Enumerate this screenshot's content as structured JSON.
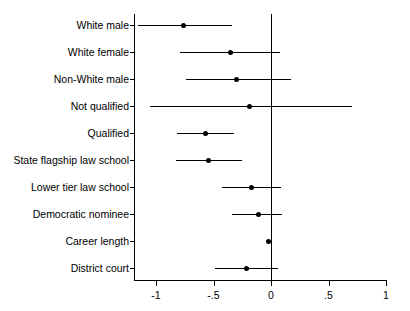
{
  "chart_data": {
    "type": "scatter",
    "subtype": "coefficient-forest-plot",
    "title": "",
    "subtitle": "",
    "xlabel": "",
    "ylabel": "",
    "xlim": [
      -1.25,
      1.05
    ],
    "xticks": [
      -1,
      -0.5,
      0,
      0.5,
      1
    ],
    "xtick_labels": [
      "-1",
      "-.5",
      "0",
      ".5",
      "1"
    ],
    "grid": false,
    "legend": null,
    "reference_line": 0,
    "categories": [
      "White male",
      "White female",
      "Non-White male",
      "Not qualified",
      "Qualified",
      "State flagship law school",
      "Lower tier law school",
      "Democratic nominee",
      "Career length",
      "District court"
    ],
    "estimates": [
      -0.76,
      -0.35,
      -0.3,
      -0.19,
      -0.57,
      -0.54,
      -0.17,
      -0.11,
      -0.02,
      -0.21
    ],
    "ci_low": [
      -1.16,
      -0.79,
      -0.74,
      -1.05,
      -0.82,
      -0.83,
      -0.43,
      -0.34,
      -0.04,
      -0.49
    ],
    "ci_high": [
      -0.34,
      0.08,
      0.17,
      0.7,
      -0.32,
      -0.25,
      0.09,
      0.1,
      0.0,
      0.06
    ],
    "points": [
      {
        "label": "White male",
        "estimate": -0.76,
        "ci_low": -1.16,
        "ci_high": -0.34
      },
      {
        "label": "White female",
        "estimate": -0.35,
        "ci_low": -0.79,
        "ci_high": 0.08
      },
      {
        "label": "Non-White male",
        "estimate": -0.3,
        "ci_low": -0.74,
        "ci_high": 0.17
      },
      {
        "label": "Not qualified",
        "estimate": -0.19,
        "ci_low": -1.05,
        "ci_high": 0.7
      },
      {
        "label": "Qualified",
        "estimate": -0.57,
        "ci_low": -0.82,
        "ci_high": -0.32
      },
      {
        "label": "State flagship law school",
        "estimate": -0.54,
        "ci_low": -0.83,
        "ci_high": -0.25
      },
      {
        "label": "Lower tier law school",
        "estimate": -0.17,
        "ci_low": -0.43,
        "ci_high": 0.09
      },
      {
        "label": "Democratic nominee",
        "estimate": -0.11,
        "ci_low": -0.34,
        "ci_high": 0.1
      },
      {
        "label": "Career length",
        "estimate": -0.02,
        "ci_low": -0.04,
        "ci_high": 0.0
      },
      {
        "label": "District court",
        "estimate": -0.21,
        "ci_low": -0.49,
        "ci_high": 0.06
      }
    ],
    "colors": {
      "marker": "#000000",
      "line": "#000000",
      "axis": "#000000",
      "background": "#ffffff"
    }
  }
}
